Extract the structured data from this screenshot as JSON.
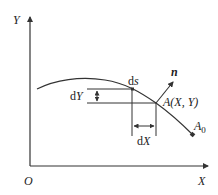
{
  "diagram": {
    "axes": {
      "y_label": "Y",
      "x_label": "X",
      "origin_label": "O"
    },
    "labels": {
      "ds_prefix": "d",
      "ds_var": "s",
      "n_vector": "n",
      "point_A": "A(X, Y)",
      "point_A0_base": "A",
      "point_A0_sub": "0",
      "dY_prefix": "d",
      "dY_var": "Y",
      "dX_prefix": "d",
      "dX_var": "X"
    },
    "colors": {
      "stroke": "#333333",
      "text": "#222222"
    }
  }
}
